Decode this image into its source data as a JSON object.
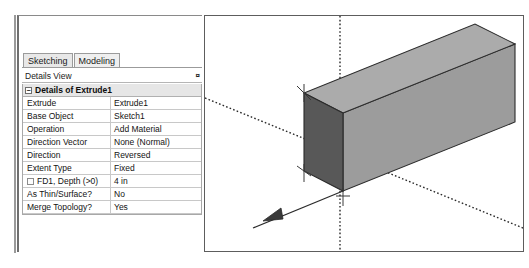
{
  "panel": {
    "tabs": [
      {
        "label": "Sketching",
        "active": false
      },
      {
        "label": "Modeling",
        "active": true
      }
    ],
    "header": {
      "title": "Details View",
      "pin_glyph": "¤"
    },
    "group": {
      "expander_glyph": "−",
      "title": "Details of Extrude1"
    },
    "rows": [
      {
        "name": "Extrude",
        "value": "Extrude1",
        "checkbox": false
      },
      {
        "name": "Base Object",
        "value": "Sketch1",
        "checkbox": false
      },
      {
        "name": "Operation",
        "value": "Add Material",
        "checkbox": false
      },
      {
        "name": "Direction Vector",
        "value": "None (Normal)",
        "checkbox": false
      },
      {
        "name": "Direction",
        "value": "Reversed",
        "checkbox": false
      },
      {
        "name": "Extent Type",
        "value": "Fixed",
        "checkbox": false
      },
      {
        "name": "FD1,  Depth (>0)",
        "value": "4 in",
        "checkbox": true
      },
      {
        "name": "As Thin/Surface?",
        "value": "No",
        "checkbox": false
      },
      {
        "name": "Merge Topology?",
        "value": "Yes",
        "checkbox": false
      }
    ]
  },
  "viewport": {
    "name": "graphics-viewport",
    "background": "#ffffff",
    "solid": {
      "name": "extruded-box",
      "top_face_color": "#a9a9a9",
      "side_face_color": "#9b9b9b",
      "end_face_color": "#595959",
      "edge_color": "#2b2b2b"
    },
    "axes": {
      "vertical_axis_color": "#2a2a2a",
      "diagonal_axis_color": "#2a2a2a",
      "style": "dotted"
    },
    "direction_arrow": {
      "name": "extrude-direction-arrow",
      "color": "#2a2a2a"
    }
  }
}
